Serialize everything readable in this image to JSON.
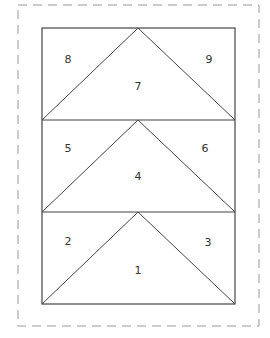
{
  "colors": {
    "background": "#ffffff",
    "outline": "#444444",
    "dashed_border": "#999999",
    "label": "#333333"
  },
  "pieces": [
    {
      "id": "piece-1",
      "label": "1",
      "row": "bottom",
      "position": "center-triangle"
    },
    {
      "id": "piece-2",
      "label": "2",
      "row": "bottom",
      "position": "left-corner"
    },
    {
      "id": "piece-3",
      "label": "3",
      "row": "bottom",
      "position": "right-corner"
    },
    {
      "id": "piece-4",
      "label": "4",
      "row": "middle",
      "position": "center-triangle"
    },
    {
      "id": "piece-5",
      "label": "5",
      "row": "middle",
      "position": "left-corner"
    },
    {
      "id": "piece-6",
      "label": "6",
      "row": "middle",
      "position": "right-corner"
    },
    {
      "id": "piece-7",
      "label": "7",
      "row": "top",
      "position": "center-triangle"
    },
    {
      "id": "piece-8",
      "label": "8",
      "row": "top",
      "position": "left-corner"
    },
    {
      "id": "piece-9",
      "label": "9",
      "row": "top",
      "position": "right-corner"
    }
  ]
}
